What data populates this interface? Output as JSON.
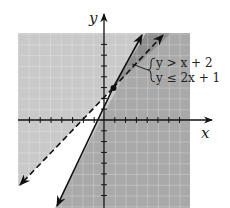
{
  "figure": {
    "type": "system-of-linear-inequalities-graph",
    "x_axis_label": "x",
    "y_axis_label": "y",
    "system": {
      "inequality_1": "y > x + 2",
      "inequality_2": "y ≤ 2x + 1"
    },
    "lines": [
      {
        "equation": "y = x + 2",
        "style": "dashed",
        "slope": 1,
        "intercept": 2
      },
      {
        "equation": "y = 2x + 1",
        "style": "solid",
        "slope": 2,
        "intercept": 1
      }
    ],
    "intersection_point": {
      "x": 1,
      "y": 3
    },
    "grid": {
      "xmin": -8,
      "xmax": 8,
      "ymin": -8,
      "ymax": 8
    },
    "colors": {
      "light_shade": "#c8c8c8",
      "medium_shade": "#a8a8a8",
      "dark_shade": "#8c8c8c",
      "unshaded": "#ffffff",
      "line": "#111111"
    }
  }
}
